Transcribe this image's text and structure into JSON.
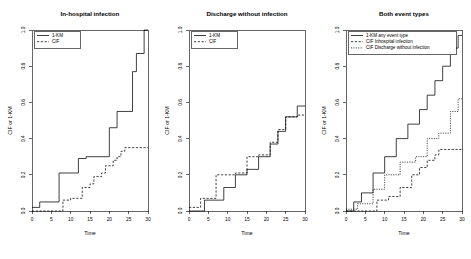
{
  "figure": {
    "background": "#ffffff",
    "foreground": "#000000",
    "panel_count": 3,
    "width": 471,
    "height": 259
  },
  "chart_data": [
    {
      "type": "line",
      "subtype": "step",
      "title": "In-hospital infection",
      "xlabel": "Time",
      "ylabel": "CIF or 1-KM",
      "xlim": [
        0,
        30
      ],
      "ylim": [
        0.0,
        1.0
      ],
      "xticks": [
        0,
        5,
        10,
        15,
        20,
        25,
        30
      ],
      "xticklabels": [
        "0",
        "5",
        "10",
        "15",
        "20",
        "25",
        "30"
      ],
      "yticks": [
        0.0,
        0.2,
        0.4,
        0.6,
        0.8,
        1.0
      ],
      "yticklabels": [
        "0.0",
        "0.2",
        "0.4",
        "0.6",
        "0.8",
        "1.0"
      ],
      "grid": false,
      "legend_position": "top-left",
      "series": [
        {
          "name": "1-KM",
          "style": "solid",
          "x": [
            0,
            2,
            2,
            7,
            7,
            12,
            12,
            14,
            14,
            20,
            20,
            22,
            22,
            26,
            26,
            27,
            27,
            29,
            29,
            30
          ],
          "y": [
            0.02,
            0.02,
            0.05,
            0.05,
            0.21,
            0.21,
            0.29,
            0.29,
            0.3,
            0.3,
            0.46,
            0.46,
            0.55,
            0.55,
            0.77,
            0.77,
            0.87,
            0.87,
            1.0,
            1.0
          ]
        },
        {
          "name": "CIF",
          "style": "dashed",
          "x": [
            0,
            8,
            8,
            10,
            10,
            13,
            13,
            15,
            15,
            16,
            16,
            18,
            18,
            19,
            19,
            21,
            21,
            22,
            22,
            23,
            23,
            24,
            24,
            30
          ],
          "y": [
            0.0,
            0.0,
            0.06,
            0.06,
            0.07,
            0.07,
            0.13,
            0.13,
            0.15,
            0.15,
            0.19,
            0.19,
            0.21,
            0.21,
            0.25,
            0.25,
            0.28,
            0.28,
            0.3,
            0.3,
            0.33,
            0.33,
            0.35,
            0.35
          ]
        }
      ]
    },
    {
      "type": "line",
      "subtype": "step",
      "title": "Discharge without infection",
      "xlabel": "Time",
      "ylabel": "CIF or 1-KM",
      "xlim": [
        0,
        30
      ],
      "ylim": [
        0.0,
        1.0
      ],
      "xticks": [
        0,
        5,
        10,
        15,
        20,
        25,
        30
      ],
      "xticklabels": [
        "0",
        "5",
        "10",
        "15",
        "20",
        "25",
        "30"
      ],
      "yticks": [
        0.0,
        0.2,
        0.4,
        0.6,
        0.8,
        1.0
      ],
      "yticklabels": [
        "0.0",
        "0.2",
        "0.4",
        "0.6",
        "0.8",
        "1.0"
      ],
      "grid": false,
      "legend_position": "top-left",
      "series": [
        {
          "name": "1-KM",
          "style": "solid",
          "x": [
            0,
            4,
            4,
            9,
            9,
            12,
            12,
            15,
            15,
            18,
            18,
            21,
            21,
            23,
            23,
            25,
            25,
            28,
            28,
            30
          ],
          "y": [
            0.0,
            0.0,
            0.06,
            0.06,
            0.13,
            0.13,
            0.2,
            0.2,
            0.23,
            0.23,
            0.3,
            0.3,
            0.37,
            0.37,
            0.44,
            0.44,
            0.52,
            0.52,
            0.58,
            0.58
          ]
        },
        {
          "name": "CIF",
          "style": "dashed",
          "x": [
            0,
            3,
            3,
            7,
            7,
            12,
            12,
            15,
            15,
            18,
            18,
            21,
            21,
            23,
            23,
            25,
            25,
            28,
            28,
            30
          ],
          "y": [
            0.02,
            0.02,
            0.07,
            0.07,
            0.2,
            0.2,
            0.21,
            0.21,
            0.3,
            0.3,
            0.31,
            0.31,
            0.38,
            0.38,
            0.45,
            0.45,
            0.52,
            0.52,
            0.53,
            0.53
          ]
        }
      ]
    },
    {
      "type": "line",
      "subtype": "step",
      "title": "Both event types",
      "xlabel": "Time",
      "ylabel": "CIF or 1-KM",
      "xlim": [
        0,
        30
      ],
      "ylim": [
        0.0,
        1.0
      ],
      "xticks": [
        0,
        5,
        10,
        15,
        20,
        25,
        30
      ],
      "xticklabels": [
        "0",
        "5",
        "10",
        "15",
        "20",
        "25",
        "30"
      ],
      "yticks": [
        0.0,
        0.2,
        0.4,
        0.6,
        0.8,
        1.0
      ],
      "yticklabels": [
        "0.0",
        "0.2",
        "0.4",
        "0.6",
        "0.8",
        "1.0"
      ],
      "grid": false,
      "legend_position": "top-left",
      "series": [
        {
          "name": "1-KM any event type",
          "style": "solid",
          "x": [
            0,
            2,
            2,
            4,
            4,
            7,
            7,
            10,
            10,
            13,
            13,
            16,
            16,
            19,
            19,
            21,
            21,
            23,
            23,
            25,
            25,
            27,
            27,
            29,
            29,
            30
          ],
          "y": [
            0.0,
            0.0,
            0.05,
            0.05,
            0.1,
            0.1,
            0.21,
            0.21,
            0.3,
            0.3,
            0.4,
            0.4,
            0.48,
            0.48,
            0.56,
            0.56,
            0.64,
            0.64,
            0.72,
            0.72,
            0.8,
            0.8,
            0.9,
            0.9,
            0.97,
            0.97
          ]
        },
        {
          "name": "CIF Inhospital infection",
          "style": "dashed",
          "x": [
            0,
            8,
            8,
            11,
            11,
            14,
            14,
            17,
            17,
            19,
            19,
            21,
            21,
            23,
            23,
            24,
            24,
            30
          ],
          "y": [
            0.0,
            0.0,
            0.06,
            0.06,
            0.08,
            0.08,
            0.13,
            0.13,
            0.2,
            0.2,
            0.24,
            0.24,
            0.28,
            0.28,
            0.31,
            0.31,
            0.34,
            0.34
          ]
        },
        {
          "name": "CIF Discharge without infection",
          "style": "dotted",
          "x": [
            0,
            3,
            3,
            7,
            7,
            10,
            10,
            14,
            14,
            18,
            18,
            21,
            21,
            24,
            24,
            27,
            27,
            29,
            29,
            30
          ],
          "y": [
            0.01,
            0.01,
            0.04,
            0.04,
            0.12,
            0.12,
            0.2,
            0.2,
            0.27,
            0.27,
            0.3,
            0.3,
            0.4,
            0.4,
            0.43,
            0.43,
            0.55,
            0.55,
            0.62,
            0.62
          ]
        }
      ]
    }
  ]
}
